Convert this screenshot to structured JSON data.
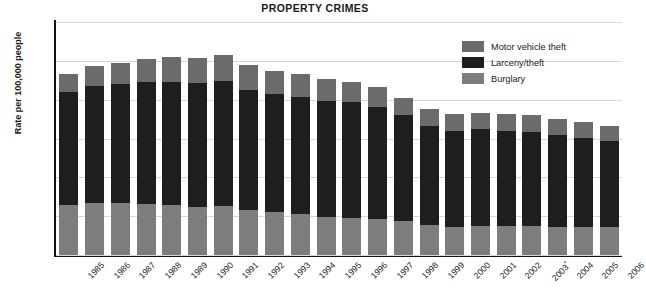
{
  "chart_data": {
    "type": "bar",
    "subtype": "stacked-vertical",
    "title": "PROPERTY CRIMES",
    "xlabel": "",
    "ylabel": "Rate per 100,000 people",
    "ylim": [
      0,
      6000
    ],
    "yticks": [
      "0",
      "1,000",
      "2,000",
      "3,000",
      "4,000",
      "5,000",
      "6,000"
    ],
    "ytick_values": [
      0,
      1000,
      2000,
      3000,
      4000,
      5000,
      6000
    ],
    "grid": true,
    "grid_axis": "y",
    "legend_position": "top-right",
    "categories": [
      "1985",
      "1986",
      "1987",
      "1988",
      "1989",
      "1990",
      "1991",
      "1992",
      "1993",
      "1994",
      "1995",
      "1996",
      "1997",
      "1998",
      "1999",
      "2000",
      "2001",
      "2002",
      "2003",
      "2004",
      "2005",
      "2006"
    ],
    "category_notes": {
      "2003": "*"
    },
    "series": [
      {
        "name": "Burglary",
        "color": "#7d7d7d",
        "values": [
          1290,
          1345,
          1330,
          1310,
          1280,
          1230,
          1250,
          1160,
          1105,
          1045,
          990,
          950,
          920,
          865,
          775,
          730,
          745,
          750,
          745,
          730,
          730,
          730
        ]
      },
      {
        "name": "Larceny/theft",
        "color": "#1e1e1e",
        "values": [
          2910,
          3010,
          3080,
          3140,
          3180,
          3190,
          3230,
          3100,
          3035,
          3030,
          2980,
          2980,
          2890,
          2730,
          2555,
          2475,
          2490,
          2455,
          2415,
          2360,
          2290,
          2205
        ]
      },
      {
        "name": "Motor vehicle theft",
        "color": "#6b6b6b",
        "values": [
          465,
          510,
          530,
          590,
          630,
          655,
          660,
          630,
          605,
          590,
          560,
          525,
          505,
          460,
          420,
          415,
          430,
          430,
          433,
          422,
          417,
          399
        ]
      }
    ],
    "totals": [
      4665,
      4865,
      4940,
      5040,
      5090,
      5075,
      5140,
      4890,
      4745,
      4665,
      4530,
      4455,
      4315,
      4055,
      3750,
      3620,
      3665,
      3635,
      3593,
      3512,
      3437,
      3334
    ]
  },
  "legend": {
    "items": [
      {
        "label": "Motor vehicle theft",
        "color": "#6b6b6b"
      },
      {
        "label": "Larceny/theft",
        "color": "#1e1e1e"
      },
      {
        "label": "Burglary",
        "color": "#7d7d7d"
      }
    ]
  }
}
